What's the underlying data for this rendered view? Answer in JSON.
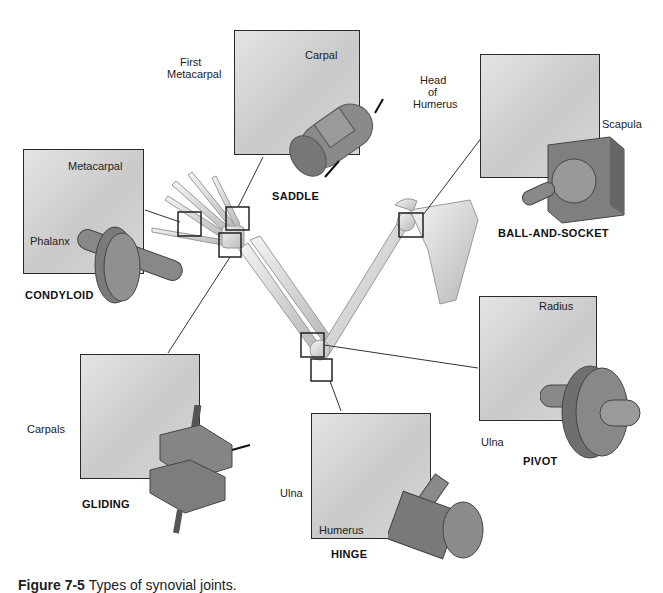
{
  "joints": [
    {
      "id": "saddle",
      "title": "SADDLE",
      "labels": [
        "First Metacarpal",
        "Carpal"
      ]
    },
    {
      "id": "ball-and-socket",
      "title": "BALL-AND-SOCKET",
      "labels": [
        "Head of Humerus",
        "Scapula"
      ]
    },
    {
      "id": "condyloid",
      "title": "CONDYLOID",
      "labels": [
        "Metacarpal",
        "Phalanx"
      ]
    },
    {
      "id": "gliding",
      "title": "GLIDING",
      "labels": [
        "Carpals"
      ]
    },
    {
      "id": "hinge",
      "title": "HINGE",
      "labels": [
        "Ulna",
        "Humerus"
      ]
    },
    {
      "id": "pivot",
      "title": "PIVOT",
      "labels": [
        "Radius",
        "Ulna"
      ]
    }
  ],
  "labels": {
    "saddle_first": "First",
    "saddle_metacarpal": "Metacarpal",
    "saddle_carpal": "Carpal",
    "ball_head": "Head",
    "ball_of": "of",
    "ball_humerus": "Humerus",
    "ball_scapula": "Scapula",
    "cond_metacarpal": "Metacarpal",
    "cond_phalanx": "Phalanx",
    "glide_carpals": "Carpals",
    "hinge_ulna": "Ulna",
    "hinge_humerus": "Humerus",
    "pivot_radius": "Radius",
    "pivot_ulna": "Ulna"
  },
  "titles": {
    "saddle": "SADDLE",
    "ball": "BALL-AND-SOCKET",
    "condyloid": "CONDYLOID",
    "gliding": "GLIDING",
    "hinge": "HINGE",
    "pivot": "PIVOT"
  },
  "caption": {
    "number": "Figure 7-5",
    "text": "Types of synovial joints."
  }
}
